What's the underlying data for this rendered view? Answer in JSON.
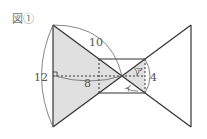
{
  "figure": {
    "label": "図①",
    "measurements": {
      "slant": "10",
      "height": "12",
      "center_distance": "8",
      "rect_height": "4"
    },
    "angle_labels": {
      "a": "ア",
      "i": "イ"
    }
  },
  "colors": {
    "line": "#333333",
    "shade": "#e0e0e0",
    "text": "#555555"
  }
}
